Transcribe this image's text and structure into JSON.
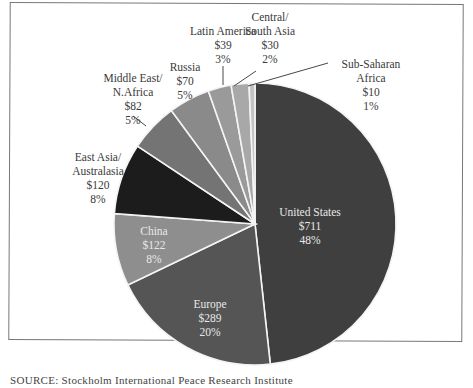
{
  "chart_data": {
    "type": "pie",
    "title": "",
    "unit": "$ billions",
    "start_angle_deg": 0,
    "direction": "clockwise",
    "slices": [
      {
        "label": "United States",
        "value": 711,
        "value_label": "$711",
        "percent": 48,
        "percent_label": "48%",
        "color": "#3f3f3f"
      },
      {
        "label": "Europe",
        "value": 289,
        "value_label": "$289",
        "percent": 20,
        "percent_label": "20%",
        "color": "#555555"
      },
      {
        "label": "China",
        "value": 122,
        "value_label": "$122",
        "percent": 8,
        "percent_label": "8%",
        "color": "#8e8e8e"
      },
      {
        "label": "East Asia/ Australasia",
        "value": 120,
        "value_label": "$120",
        "percent": 8,
        "percent_label": "8%",
        "color": "#1c1c1c"
      },
      {
        "label": "Middle East/ N.Africa",
        "value": 82,
        "value_label": "$82",
        "percent": 5,
        "percent_label": "5%",
        "color": "#747474"
      },
      {
        "label": "Russia",
        "value": 70,
        "value_label": "$70",
        "percent": 5,
        "percent_label": "5%",
        "color": "#8a8a8a"
      },
      {
        "label": "Latin America",
        "value": 39,
        "value_label": "$39",
        "percent": 3,
        "percent_label": "3%",
        "color": "#9a9a9a"
      },
      {
        "label": "Central/ South Asia",
        "value": 30,
        "value_label": "$30",
        "percent": 2,
        "percent_label": "2%",
        "color": "#a8a8a8"
      },
      {
        "label": "Sub-Saharan Africa",
        "value": 10,
        "value_label": "$10",
        "percent": 1,
        "percent_label": "1%",
        "color": "#c4c4c4"
      }
    ],
    "legend": "none (direct labels)",
    "source": "SOURCE: Stockholm International Peace Research Institute"
  },
  "labels": {
    "us": {
      "l1": "United States",
      "l2": "$711",
      "l3": "48%"
    },
    "europe": {
      "l1": "Europe",
      "l2": "$289",
      "l3": "20%"
    },
    "china": {
      "l1": "China",
      "l2": "$122",
      "l3": "8%"
    },
    "eastasia": {
      "l1": "East Asia/",
      "l2": "Australasia",
      "l3": "$120",
      "l4": "8%"
    },
    "mideast": {
      "l1": "Middle East/",
      "l2": "N.Africa",
      "l3": "$82",
      "l4": "5%"
    },
    "russia": {
      "l1": "Russia",
      "l2": "$70",
      "l3": "5%"
    },
    "latam": {
      "l1": "Latin America",
      "l2": "$39",
      "l3": "3%"
    },
    "csasia": {
      "l1": "Central/",
      "l2": "South Asia",
      "l3": "$30",
      "l4": "2%"
    },
    "ssafrica": {
      "l1": "Sub-Saharan",
      "l2": "Africa",
      "l3": "$10",
      "l4": "1%"
    }
  },
  "source_text": "SOURCE: Stockholm International Peace Research Institute"
}
